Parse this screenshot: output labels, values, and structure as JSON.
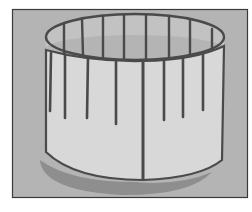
{
  "image": {
    "subject": "paper cylinder with slit strips",
    "style": "grayscale illustration",
    "colors": {
      "page_bg": "#ffffff",
      "frame_bg": "#b4b4b4",
      "frame_border": "#3a3a3a",
      "cylinder_outer": "#d8d8d8",
      "cylinder_inner": "#c2c2c2",
      "line": "#4a4a4a",
      "shadow": "#8e8e8e"
    },
    "frame": {
      "x": 12,
      "y": 9,
      "width": 236,
      "height": 189
    },
    "rim": {
      "cx": 135,
      "cy": 37,
      "rx": 89,
      "ry": 23
    },
    "base": {
      "cx": 135,
      "cy": 150,
      "rx": 89,
      "ry": 30
    },
    "front_strips": [
      {
        "x": 51,
        "top": 53,
        "bottom": 111
      },
      {
        "x": 65,
        "top": 54,
        "bottom": 118
      },
      {
        "x": 88,
        "top": 57,
        "bottom": 118
      },
      {
        "x": 116,
        "top": 60,
        "bottom": 124
      },
      {
        "x": 164,
        "top": 60,
        "bottom": 120
      },
      {
        "x": 183,
        "top": 58,
        "bottom": 117
      },
      {
        "x": 203,
        "top": 54,
        "bottom": 110
      }
    ],
    "seam": {
      "x": 143,
      "top": 60,
      "bottom": 180
    },
    "back_strips": [
      64,
      82,
      103,
      124,
      146,
      169,
      190,
      212
    ]
  }
}
